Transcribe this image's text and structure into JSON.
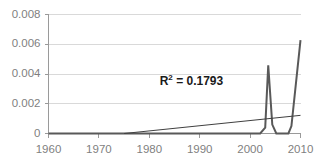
{
  "chart_data": {
    "type": "line",
    "title": "",
    "xlabel": "",
    "ylabel": "",
    "xlim": [
      1960,
      2010
    ],
    "ylim": [
      0,
      0.008
    ],
    "grid": true,
    "legend": "none",
    "x_ticks": [
      "1960",
      "1970",
      "1980",
      "1990",
      "2000",
      "2010"
    ],
    "x_tick_values": [
      1960,
      1970,
      1980,
      1990,
      2000,
      2010
    ],
    "y_ticks": [
      "0",
      "0.002",
      "0.004",
      "0.006",
      "0.008"
    ],
    "y_tick_values": [
      0,
      0.002,
      0.004,
      0.006,
      0.008
    ],
    "annotations": [
      {
        "name": "r-squared",
        "text_prefix": "R",
        "text_sup": "2",
        "text_suffix": " = 0.1793",
        "value": 0.1793,
        "x": 1990,
        "y": 0.0035
      }
    ],
    "series": [
      {
        "name": "data",
        "type": "line",
        "color": "#595959",
        "width": 2,
        "x": [
          1960,
          1975,
          1990,
          2000,
          2002,
          2003,
          2003.6,
          2004.4,
          2005.2,
          2006,
          2007.6,
          2008.2,
          2010
        ],
        "values": [
          0,
          0,
          0,
          0,
          0,
          0.0004,
          0.00458,
          0.0006,
          0,
          0,
          0,
          0.0005,
          0.00628
        ]
      },
      {
        "name": "linear-trendline",
        "type": "line",
        "color": "#404040",
        "width": 1,
        "x": [
          1975,
          2010
        ],
        "values": [
          0,
          0.00122
        ]
      }
    ]
  },
  "axes": {
    "y_axis_name": "value-axis",
    "x_axis_name": "year-axis"
  },
  "colors": {
    "gridline": "#d9d9d9",
    "axis": "#9a9a9a",
    "tick_text": "#7f7f7f",
    "series": "#595959",
    "trendline": "#404040",
    "annotation": "#1a1a1a",
    "background": "#ffffff"
  }
}
